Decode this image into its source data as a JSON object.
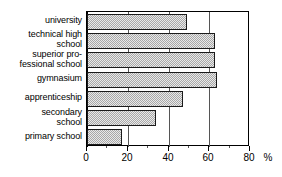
{
  "chart_data": {
    "type": "bar",
    "orientation": "horizontal",
    "title": "",
    "xlabel": "%",
    "ylabel": "",
    "categories": [
      "university",
      "technical high\nschool",
      "superior pro-\nfessional school",
      "gymnasium",
      "apprenticeship",
      "secondary\nschool",
      "primary school"
    ],
    "values": [
      49,
      63,
      63,
      64,
      47,
      34,
      17
    ],
    "xlim": [
      0,
      80
    ],
    "xticks": [
      0,
      20,
      40,
      60,
      80
    ],
    "xticklabels": [
      "0",
      "20",
      "40",
      "60",
      "80"
    ],
    "minor_xticks": [
      10,
      30,
      50,
      70
    ],
    "grid": true,
    "legend": null,
    "unit": "%",
    "bar_fill": "#a8a8a8",
    "bar_edge": "#1a1a1a",
    "axis_color": "#000000"
  }
}
